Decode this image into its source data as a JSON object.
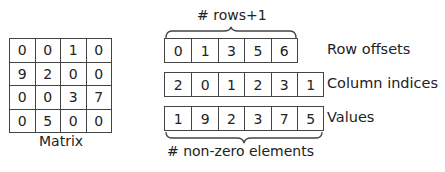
{
  "matrix": {
    "caption": "Matrix",
    "rows": [
      [
        "0",
        "0",
        "1",
        "0"
      ],
      [
        "9",
        "2",
        "0",
        "0"
      ],
      [
        "0",
        "0",
        "3",
        "7"
      ],
      [
        "0",
        "5",
        "0",
        "0"
      ]
    ]
  },
  "csr": {
    "top_annotation": "# rows+1",
    "bottom_annotation": "# non-zero elements",
    "row_offsets": {
      "label": "Row offsets",
      "values": [
        "0",
        "1",
        "3",
        "5",
        "6"
      ]
    },
    "column_indices": {
      "label": "Column indices",
      "values": [
        "2",
        "0",
        "1",
        "2",
        "3",
        "1"
      ]
    },
    "values": {
      "label": "Values",
      "values": [
        "1",
        "9",
        "2",
        "3",
        "7",
        "5"
      ]
    }
  },
  "colors": {
    "line": "#444444",
    "text": "#222222"
  }
}
